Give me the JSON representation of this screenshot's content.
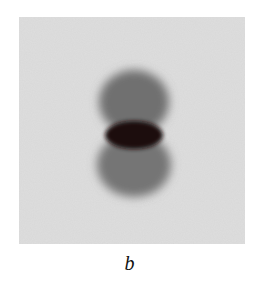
{
  "figure": {
    "panel_label": "b",
    "image": {
      "description": "Grayscale photograph of a dumbbell-shaped density with two gray lobes (upper and lower) and a dark elliptical band at the center",
      "background_color": "#dcdcdc",
      "lobe_color": "#6e6e6e",
      "center_band_color": "#1a0f10"
    }
  }
}
